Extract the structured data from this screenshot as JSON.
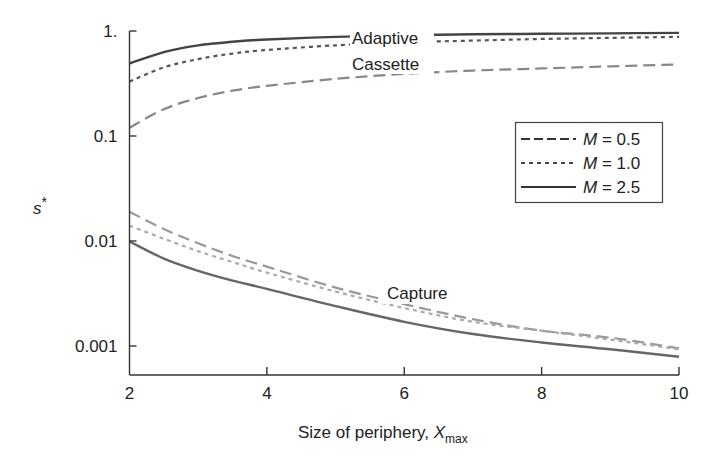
{
  "chart_data": {
    "type": "line",
    "title": "",
    "xlabel": "Size of periphery, X_max",
    "xlabel_main": "Size of periphery, ",
    "xlabel_var": "X",
    "xlabel_sub": "max",
    "ylabel": "s*",
    "ylabel_main": "s",
    "ylabel_sup": "*",
    "yscale": "log",
    "xlim": [
      2,
      10
    ],
    "ylim": [
      0.0006,
      1
    ],
    "grid": false,
    "x_ticks": [
      2,
      4,
      6,
      8,
      10
    ],
    "x_tick_labels": [
      "2",
      "4",
      "6",
      "8",
      "10"
    ],
    "y_ticks": [
      1,
      0.1,
      0.01,
      0.001
    ],
    "y_tick_labels": [
      "1.",
      "0.1",
      "0.01",
      "0.001"
    ],
    "legend": {
      "position": "upper right (inside)",
      "entries": [
        {
          "label_var": "M",
          "label_rest": " = 0.5",
          "style": "dashed"
        },
        {
          "label_var": "M",
          "label_rest": " = 1.0",
          "style": "dotted"
        },
        {
          "label_var": "M",
          "label_rest": " = 2.5",
          "style": "solid"
        }
      ]
    },
    "annotations": [
      {
        "text": "Adaptive",
        "x": 5.9,
        "y": 0.92
      },
      {
        "text": "Cassette",
        "x": 5.9,
        "y": 0.42
      },
      {
        "text": "Capture",
        "x": 6.3,
        "y": 0.0016
      }
    ],
    "x": [
      2,
      2.5,
      3,
      3.5,
      4,
      5,
      6,
      7,
      8,
      9,
      10
    ],
    "series": [
      {
        "name": "Adaptive, M = 2.5",
        "group": "Adaptive",
        "style": "solid",
        "color": "#444444",
        "values": [
          0.49,
          0.63,
          0.73,
          0.79,
          0.83,
          0.88,
          0.91,
          0.93,
          0.94,
          0.95,
          0.96
        ]
      },
      {
        "name": "Adaptive, M = 1.0",
        "group": "Adaptive",
        "style": "dotted",
        "color": "#555555",
        "values": [
          0.33,
          0.45,
          0.54,
          0.61,
          0.66,
          0.73,
          0.78,
          0.81,
          0.84,
          0.86,
          0.88
        ]
      },
      {
        "name": "Cassette, M = 0.5",
        "group": "Cassette",
        "style": "dashed",
        "color": "#888888",
        "values": [
          0.12,
          0.18,
          0.23,
          0.27,
          0.3,
          0.35,
          0.39,
          0.42,
          0.44,
          0.46,
          0.48
        ]
      },
      {
        "name": "Capture, M = 0.5",
        "group": "Capture",
        "style": "dashed",
        "color": "#999999",
        "values": [
          0.019,
          0.013,
          0.0095,
          0.0072,
          0.0057,
          0.0036,
          0.0025,
          0.0018,
          0.0014,
          0.0012,
          0.00095
        ]
      },
      {
        "name": "Capture, M = 1.0",
        "group": "Capture",
        "style": "dotted",
        "color": "#aaaaaa",
        "values": [
          0.014,
          0.0105,
          0.008,
          0.0063,
          0.005,
          0.0033,
          0.0023,
          0.0017,
          0.0014,
          0.00115,
          0.00093
        ]
      },
      {
        "name": "Capture, M = 2.5",
        "group": "Capture",
        "style": "solid",
        "color": "#666666",
        "values": [
          0.0099,
          0.0068,
          0.0052,
          0.0042,
          0.0035,
          0.0024,
          0.0017,
          0.0013,
          0.00108,
          0.00093,
          0.00079
        ]
      }
    ]
  }
}
